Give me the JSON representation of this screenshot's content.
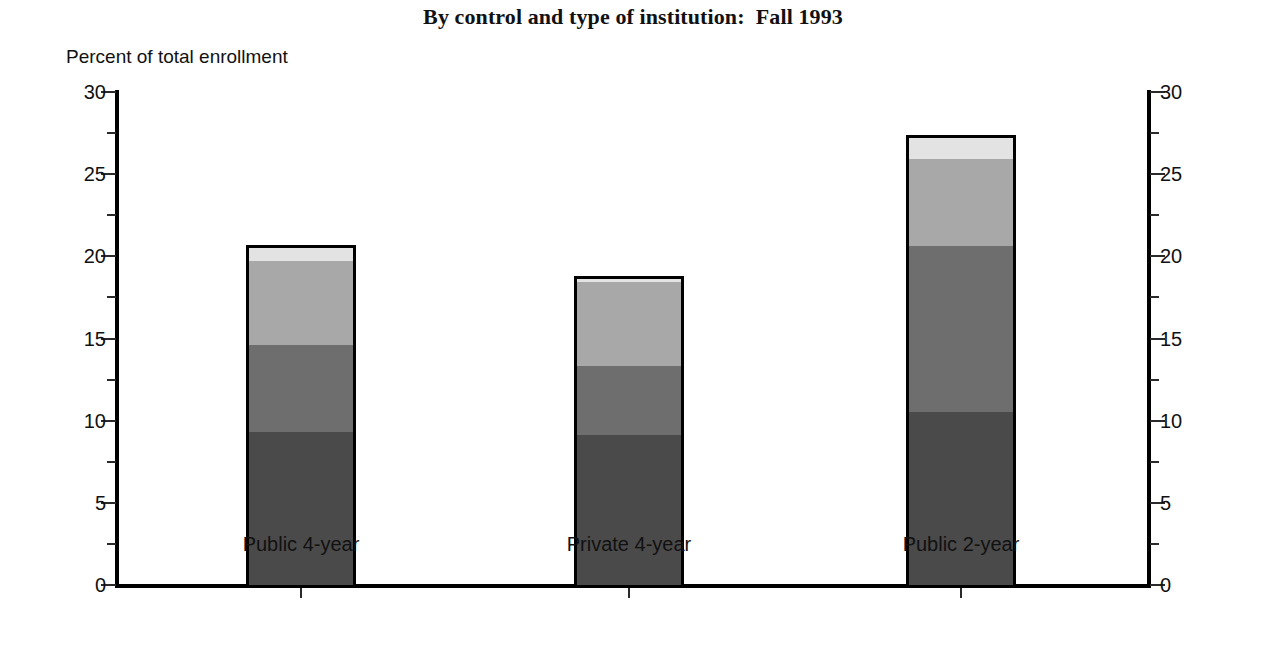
{
  "chart_data": {
    "type": "bar",
    "subtype": "stacked-vertical",
    "title": "By control and type of institution:  Fall 1993",
    "xlabel": "",
    "ylabel": "Percent of total enrollment",
    "ylim": [
      0,
      30
    ],
    "ytick_labels": [
      "0",
      "5",
      "10",
      "15",
      "20",
      "25",
      "30"
    ],
    "ytick_values": [
      0,
      5,
      10,
      15,
      20,
      25,
      30
    ],
    "minor_tick_values": [
      2.5,
      7.5,
      12.5,
      17.5,
      22.5,
      27.5
    ],
    "grid": false,
    "legend": "none",
    "dual_axis": true,
    "right_axis_tick_labels": [
      "0",
      "5",
      "10",
      "15",
      "20",
      "25",
      "30"
    ],
    "categories": [
      "Public 4-year",
      "Private 4-year",
      "Public 2-year"
    ],
    "series": [
      {
        "name": "segment-1",
        "color": "#4a4a4a",
        "values": [
          9.5,
          9.3,
          10.7
        ]
      },
      {
        "name": "segment-2",
        "color": "#6e6e6e",
        "values": [
          5.3,
          4.2,
          10.1
        ]
      },
      {
        "name": "segment-3",
        "color": "#a8a8a8",
        "values": [
          5.1,
          5.1,
          5.3
        ]
      },
      {
        "name": "segment-4",
        "color": "#e3e3e3",
        "values": [
          0.8,
          0.2,
          1.3
        ]
      }
    ],
    "totals": [
      20.7,
      18.6,
      27.4
    ]
  },
  "axes": {
    "left_labels": [
      "30",
      "25",
      "20",
      "15",
      "10",
      "5",
      "0"
    ],
    "right_labels": [
      "30",
      "25",
      "20",
      "15",
      "10",
      "5",
      "0"
    ]
  },
  "categories": {
    "0": "Public 4-year",
    "1": "Private 4-year",
    "2": "Public 2-year"
  }
}
